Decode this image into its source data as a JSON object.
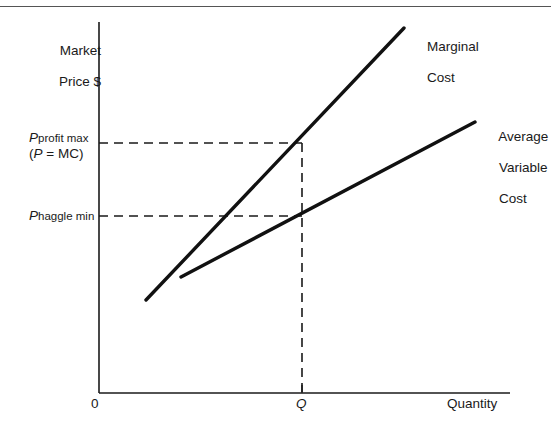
{
  "chart_data": {
    "type": "line",
    "title": "",
    "xlabel": "Quantity",
    "ylabel": "Market Price $",
    "grid": false,
    "legend_position": "inline-right",
    "axes": {
      "x_origin_label": "0",
      "x_tick_labels": [
        "Q"
      ],
      "y_tick_labels": [
        "P profit max (P = MC)",
        "P haggle min"
      ]
    },
    "annotations": [
      "Dashed horizontal line from P profit max to the Marginal Cost curve at quantity Q",
      "Dashed horizontal line from P haggle min to the Average Variable Cost curve at quantity Q",
      "Dashed vertical line from quantity Q up to the Marginal Cost curve"
    ],
    "series": [
      {
        "name": "Marginal Cost",
        "points": [
          [
            146,
            300
          ],
          [
            404,
            28
          ]
        ],
        "style": "solid",
        "color": "#111111"
      },
      {
        "name": "Average Variable Cost",
        "points": [
          [
            181,
            277
          ],
          [
            475,
            122
          ]
        ],
        "style": "solid",
        "color": "#111111"
      }
    ]
  },
  "axis": {
    "y_title_line1": "Market",
    "y_title_line2": "Price $",
    "x_title": "Quantity",
    "origin": "0",
    "q_tick": "Q"
  },
  "price_labels": {
    "profit_max_symbol": "P",
    "profit_max_subscript": "profit max",
    "profit_max_condition_open": "(",
    "profit_max_condition_var": "P",
    "profit_max_condition_rest": " = MC)",
    "haggle_min_symbol": "P",
    "haggle_min_subscript": "haggle min"
  },
  "curves": {
    "marginal_cost_line1": "Marginal",
    "marginal_cost_line2": "Cost",
    "avg_variable_cost_line1": "Average",
    "avg_variable_cost_line2": "Variable",
    "avg_variable_cost_line3": "Cost"
  },
  "colors": {
    "curve": "#111111",
    "axis": "#1a1a1a",
    "dashed": "#1a1a1a",
    "frame": "#555555",
    "background": "#ffffff"
  }
}
